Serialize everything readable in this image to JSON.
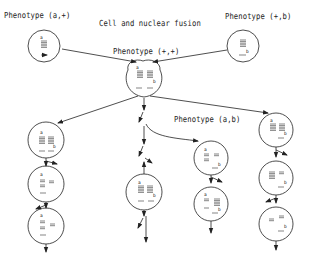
{
  "labels": {
    "parent_left": "Phenotype (a,+)",
    "parent_right": "Phenotype (+,b)",
    "fusion_title": "Cell and nuclear fusion",
    "fused": "Phenotype (+,+)",
    "branch_ab": "Phenotype (a,b)"
  },
  "markers": {
    "a": "a",
    "b": "b"
  },
  "colors": {
    "line": "#222222",
    "background": "#ffffff"
  }
}
